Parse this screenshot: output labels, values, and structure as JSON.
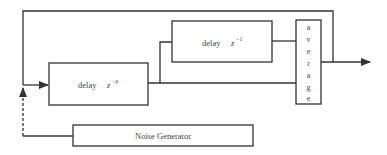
{
  "diagram": {
    "blocks": {
      "delay_p": {
        "label": "delay",
        "var": "z",
        "exponent": "−p"
      },
      "delay_1": {
        "label": "delay",
        "var": "z",
        "exponent": "−1"
      },
      "average": {
        "letters": [
          "a",
          "v",
          "e",
          "r",
          "a",
          "g",
          "e"
        ]
      },
      "noise": {
        "label": "Noise Generator"
      }
    },
    "colors": {
      "line": "#333333",
      "text": "#444444",
      "background": "#ffffff"
    }
  }
}
